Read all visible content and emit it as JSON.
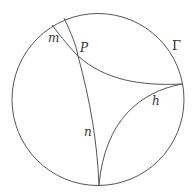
{
  "diagram": {
    "colors": {
      "stroke": "#555555",
      "text": "#333333",
      "background": "#ffffff"
    },
    "circle": {
      "label": "Γ",
      "cx": 98,
      "cy": 99.5,
      "r": 86
    },
    "labels": {
      "m": "m",
      "P": "P",
      "n": "n",
      "h": "h",
      "gamma": "Γ"
    }
  }
}
